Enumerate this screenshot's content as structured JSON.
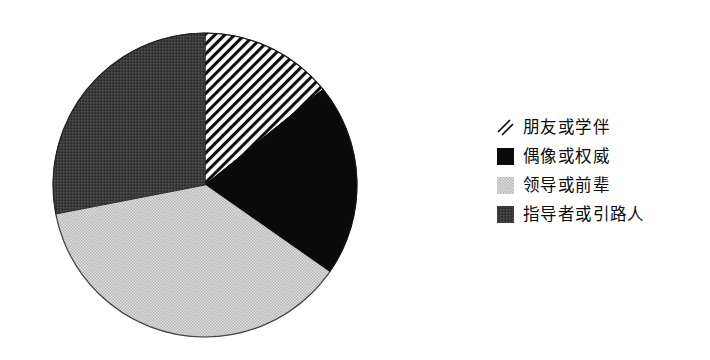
{
  "chart_data": {
    "type": "pie",
    "title": "",
    "subtitle": "",
    "xlabel": "",
    "ylabel": "",
    "grid": false,
    "legend_position": "right",
    "start_angle_deg": 0,
    "direction": "clockwise",
    "categories": [
      "朋友或学伴",
      "偶像或权威",
      "领导或前辈",
      "指导者或引路人"
    ],
    "values": [
      14,
      21,
      37,
      28
    ],
    "unit": "%",
    "slices": [
      {
        "label": "朋友或学伴",
        "value": 14,
        "start_deg": 0,
        "end_deg": 51,
        "sweep_deg": 51,
        "pattern": "diagonal-stripes",
        "color": "#000000",
        "background": "#ffffff"
      },
      {
        "label": "偶像或权威",
        "value": 21,
        "start_deg": 51,
        "end_deg": 125,
        "sweep_deg": 74,
        "pattern": "solid",
        "color": "#0a0a0a",
        "background": "#0a0a0a"
      },
      {
        "label": "领导或前辈",
        "value": 37,
        "start_deg": 125,
        "end_deg": 259,
        "sweep_deg": 134,
        "pattern": "light-dots",
        "color": "#c9c9c9",
        "background": "#cfcfcf"
      },
      {
        "label": "指导者或引路人",
        "value": 28,
        "start_deg": 259,
        "end_deg": 360,
        "sweep_deg": 101,
        "pattern": "dense-dots",
        "color": "#3a3a3a",
        "background": "#3d3d3d"
      }
    ]
  },
  "pie": {
    "center_x": 205,
    "center_y": 185,
    "radius": 152,
    "outline_color": "#111111"
  },
  "legend": {
    "items": [
      {
        "label": "朋友或学伴",
        "swatch": "hatched-swatch-icon"
      },
      {
        "label": "偶像或权威",
        "swatch": "black-swatch-icon"
      },
      {
        "label": "领导或前辈",
        "swatch": "light-gray-swatch-icon"
      },
      {
        "label": "指导者或引路人",
        "swatch": "dark-gray-swatch-icon"
      }
    ]
  },
  "colors": {
    "page_background": "#ffffff",
    "ink": "#0b0b0b",
    "light_gray": "#cfcfcf",
    "dark_gray": "#3d3d3d",
    "black": "#0a0a0a"
  }
}
